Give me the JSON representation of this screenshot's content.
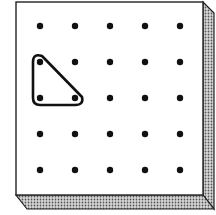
{
  "diagram": {
    "type": "geoboard",
    "grid": {
      "rows": 5,
      "cols": 5
    },
    "pegs_x": [
      40,
      75,
      110,
      145,
      180
    ],
    "pegs_y": [
      26,
      62,
      98,
      134,
      170
    ],
    "band": {
      "shape": "right-triangle",
      "vertices": [
        [
          0,
          1
        ],
        [
          0,
          2
        ],
        [
          1,
          2
        ]
      ]
    },
    "colors": {
      "board": "#ffffff",
      "outline": "#222222",
      "peg": "#111111",
      "band": "#111111",
      "edge_shade": "#9a9a9a"
    }
  }
}
